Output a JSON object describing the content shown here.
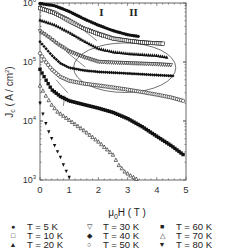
{
  "chart_data": {
    "type": "scatter",
    "title": "",
    "xlabel": "μ0H ( T )",
    "ylabel": "Jc ( A / cm²)",
    "xscale": "linear",
    "yscale": "log",
    "xlim": [
      0,
      5
    ],
    "ylim": [
      1000,
      1000000
    ],
    "xticks": [
      "0",
      "1",
      "2",
      "3",
      "4",
      "5"
    ],
    "yticks": [
      "10^3",
      "10^4",
      "10^5",
      "10^6"
    ],
    "annotations": [
      {
        "text": "I",
        "x": 2.1,
        "y": 700000
      },
      {
        "text": "II",
        "x": 3.2,
        "y": 700000
      },
      {
        "type": "ellipse",
        "label": "region boundary",
        "cx": 2.9,
        "cy": 80000,
        "rx": 1.75,
        "ry_decades": 0.42
      }
    ],
    "legend_position": "bottom",
    "series": [
      {
        "name": "T = 5 K",
        "marker": "filled-circle",
        "x": [
          0.0,
          0.5,
          1.0,
          1.5,
          2.0,
          2.5,
          3.0,
          3.4
        ],
        "y": [
          980000,
          900000,
          720000,
          540000,
          420000,
          340000,
          290000,
          270000
        ]
      },
      {
        "name": "T = 10 K",
        "marker": "open-square",
        "x": [
          0.0,
          0.5,
          1.0,
          1.5,
          2.0,
          2.5,
          3.0,
          3.5,
          4.2
        ],
        "y": [
          820000,
          680000,
          500000,
          370000,
          300000,
          250000,
          230000,
          215000,
          205000
        ]
      },
      {
        "name": "T = 20 K",
        "marker": "filled-triangle-up",
        "x": [
          0.0,
          0.5,
          1.0,
          1.5,
          2.0,
          2.5,
          3.0,
          3.5,
          4.0,
          4.4
        ],
        "y": [
          520000,
          430000,
          320000,
          230000,
          170000,
          150000,
          140000,
          135000,
          130000,
          120000
        ]
      },
      {
        "name": "T = 30 K",
        "marker": "open-triangle-down",
        "x": [
          0.0,
          0.3,
          0.6,
          1.0,
          1.5,
          2.0,
          2.5,
          3.0,
          3.5,
          4.0,
          4.5
        ],
        "y": [
          330000,
          260000,
          200000,
          150000,
          120000,
          100000,
          97000,
          95000,
          93000,
          91000,
          88000
        ]
      },
      {
        "name": "T = 40 K",
        "marker": "filled-diamond",
        "x": [
          0.0,
          0.2,
          0.4,
          0.7,
          1.0,
          1.5,
          2.0,
          2.5,
          3.0,
          3.5,
          4.0,
          4.6
        ],
        "y": [
          220000,
          170000,
          130000,
          95000,
          80000,
          72000,
          68000,
          66000,
          64000,
          62000,
          60000,
          58000
        ]
      },
      {
        "name": "T = 50 K",
        "marker": "open-circle",
        "x": [
          0.0,
          0.2,
          0.4,
          0.7,
          1.0,
          1.5,
          2.0,
          2.5,
          3.0,
          3.5,
          4.0,
          4.5,
          4.9
        ],
        "y": [
          140000,
          100000,
          75000,
          56000,
          48000,
          43000,
          40000,
          37000,
          34000,
          31000,
          28000,
          25000,
          22000
        ]
      },
      {
        "name": "T = 60 K",
        "marker": "filled-square",
        "x": [
          0.0,
          0.2,
          0.4,
          0.7,
          1.0,
          1.5,
          2.0,
          2.5,
          3.0,
          3.5,
          4.0,
          4.5,
          4.9
        ],
        "y": [
          75000,
          50000,
          34000,
          26000,
          22000,
          19000,
          16500,
          14000,
          11000,
          8000,
          5500,
          3800,
          2700
        ]
      },
      {
        "name": "T = 70 K",
        "marker": "open-triangle-up",
        "x": [
          0.0,
          0.2,
          0.4,
          0.6,
          1.0,
          1.5,
          2.0,
          2.5,
          2.7,
          2.9,
          3.1,
          3.3
        ],
        "y": [
          40000,
          27000,
          19000,
          14500,
          10500,
          7000,
          4500,
          2700,
          1800,
          1400,
          1200,
          1050
        ]
      },
      {
        "name": "T = 80 K",
        "marker": "filled-triangle-down",
        "x": [
          0.0,
          0.1,
          0.2,
          0.3,
          0.4,
          0.5,
          0.6,
          0.7,
          0.8,
          0.9,
          1.0
        ],
        "y": [
          20000,
          13000,
          9000,
          6500,
          5000,
          3800,
          3000,
          2400,
          1800,
          1400,
          1100
        ]
      }
    ]
  },
  "legend": {
    "items": [
      {
        "label": "T = 5 K",
        "symbol": "●"
      },
      {
        "label": "T = 10 K",
        "symbol": "□"
      },
      {
        "label": "T = 20 K",
        "symbol": "▲"
      },
      {
        "label": "T = 30 K",
        "symbol": "▽"
      },
      {
        "label": "T = 40 K",
        "symbol": "◆"
      },
      {
        "label": "T = 50 K",
        "symbol": "○"
      },
      {
        "label": "T = 60 K",
        "symbol": "■"
      },
      {
        "label": "T = 70 K",
        "symbol": "△"
      },
      {
        "label": "T = 80 K",
        "symbol": "▼"
      }
    ]
  },
  "axis": {
    "x_label": "μ0H ( T )",
    "y_label": "Jc ( A / cm² )"
  }
}
